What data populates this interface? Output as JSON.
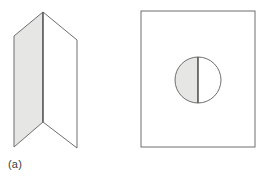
{
  "figure": {
    "width": 265,
    "height": 178,
    "background_color": "#ffffff",
    "type": "line-art-diagram"
  },
  "style": {
    "stroke_color": "#6e6e6e",
    "stroke_color_dark": "#555555",
    "shade_fill": "#e6e6e4",
    "white_fill": "#ffffff",
    "stroke_width": 1
  },
  "panels": [
    {
      "id": "a",
      "caption": "(a)",
      "shape_name": "folded-sheet",
      "shape_label": "folded sheet in perspective",
      "faces": [
        {
          "name": "left-face-shaded",
          "fill": "#e6e6e4",
          "points": "14,36 43,12 43,122 14,147"
        },
        {
          "name": "right-face-white",
          "fill": "#ffffff",
          "points": "43,12 77,40 77,148 43,122"
        }
      ],
      "fold_line": {
        "name": "center-fold-line",
        "x1": 43,
        "y1": 12,
        "x2": 43,
        "y2": 122
      },
      "vertices": {
        "apex": [
          43,
          12
        ],
        "left_top": [
          14,
          36
        ],
        "left_bottom": [
          14,
          147
        ],
        "fold_bottom": [
          43,
          122
        ],
        "right_top": [
          77,
          40
        ],
        "right_bottom": [
          77,
          148
        ]
      }
    },
    {
      "id": "b",
      "caption": "(b)",
      "shape_name": "rectangle-with-split-circle",
      "shape_label": "rectangle containing bisected circle",
      "rectangle": {
        "name": "outer-rectangle",
        "x": 8,
        "y": 11,
        "width": 114,
        "height": 136,
        "fill": "#ffffff"
      },
      "circle": {
        "name": "bisected-circle",
        "center_x": 65,
        "center_y": 80,
        "radius": 23,
        "left_half_fill": "#e6e6e4",
        "right_half_fill": "#ffffff",
        "divider": {
          "name": "vertical-diameter",
          "x1": 65,
          "y1": 57,
          "x2": 65,
          "y2": 103
        }
      }
    }
  ]
}
